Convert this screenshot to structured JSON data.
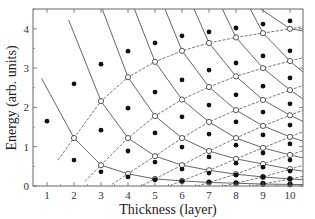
{
  "chart_data": {
    "type": "scatter",
    "title": "",
    "xlabel": "Thickness (layer)",
    "ylabel": "Energy (arb. units)",
    "xlim": [
      0.5,
      10.5
    ],
    "ylim": [
      0,
      4.5
    ],
    "x_ticks": [
      1,
      2,
      3,
      4,
      5,
      6,
      7,
      8,
      9,
      10
    ],
    "y_ticks": [
      0,
      1,
      2,
      3,
      4
    ],
    "grid": false,
    "legend": null,
    "series": [
      {
        "name": "discrete levels (filled dots)",
        "marker": "filled-circle",
        "points": [
          [
            1,
            1.65
          ],
          [
            2,
            2.6
          ],
          [
            2,
            0.66
          ],
          [
            3,
            3.1
          ],
          [
            3,
            1.42
          ],
          [
            3,
            0.36
          ],
          [
            4,
            3.43
          ],
          [
            4,
            1.98
          ],
          [
            4,
            0.89
          ],
          [
            4,
            0.23
          ],
          [
            5,
            3.64
          ],
          [
            5,
            2.39
          ],
          [
            5,
            1.35
          ],
          [
            5,
            0.61
          ],
          [
            5,
            0.16
          ],
          [
            6,
            3.82
          ],
          [
            6,
            2.7
          ],
          [
            6,
            1.76
          ],
          [
            6,
            0.99
          ],
          [
            6,
            0.43
          ],
          [
            6,
            0.12
          ],
          [
            7,
            3.92
          ],
          [
            7,
            2.95
          ],
          [
            7,
            2.06
          ],
          [
            7,
            1.32
          ],
          [
            7,
            0.74
          ],
          [
            7,
            0.33
          ],
          [
            7,
            0.1
          ],
          [
            8,
            4.02
          ],
          [
            8,
            3.13
          ],
          [
            8,
            2.32
          ],
          [
            8,
            1.63
          ],
          [
            8,
            1.04
          ],
          [
            8,
            0.58
          ],
          [
            8,
            0.28
          ],
          [
            8,
            0.08
          ],
          [
            9,
            4.12
          ],
          [
            9,
            3.31
          ],
          [
            9,
            2.54
          ],
          [
            9,
            1.88
          ],
          [
            9,
            1.3
          ],
          [
            9,
            0.84
          ],
          [
            9,
            0.48
          ],
          [
            9,
            0.23
          ],
          [
            9,
            0.07
          ],
          [
            10,
            4.2
          ],
          [
            10,
            3.44
          ],
          [
            10,
            2.75
          ],
          [
            10,
            2.09
          ],
          [
            10,
            1.55
          ],
          [
            10,
            1.07
          ],
          [
            10,
            0.66
          ],
          [
            10,
            0.38
          ],
          [
            10,
            0.18
          ],
          [
            10,
            0.05
          ]
        ]
      },
      {
        "name": "curve intersections (open circles)",
        "marker": "open-circle",
        "points": [
          [
            2,
            1.22
          ],
          [
            3,
            2.16
          ],
          [
            3,
            0.53
          ],
          [
            4,
            2.77
          ],
          [
            4,
            1.22
          ],
          [
            4,
            0.31
          ],
          [
            5,
            3.16
          ],
          [
            5,
            1.78
          ],
          [
            5,
            0.76
          ],
          [
            5,
            0.18
          ],
          [
            6,
            3.44
          ],
          [
            6,
            2.2
          ],
          [
            6,
            1.22
          ],
          [
            6,
            0.53
          ],
          [
            6,
            0.13
          ],
          [
            7,
            3.64
          ],
          [
            7,
            2.52
          ],
          [
            7,
            1.63
          ],
          [
            7,
            0.89
          ],
          [
            7,
            0.4
          ],
          [
            7,
            0.09
          ],
          [
            8,
            3.78
          ],
          [
            8,
            2.79
          ],
          [
            8,
            1.93
          ],
          [
            8,
            1.22
          ],
          [
            8,
            0.69
          ],
          [
            8,
            0.3
          ],
          [
            8,
            0.07
          ],
          [
            9,
            3.89
          ],
          [
            9,
            3.0
          ],
          [
            9,
            2.19
          ],
          [
            9,
            1.53
          ],
          [
            9,
            0.97
          ],
          [
            9,
            0.56
          ],
          [
            9,
            0.23
          ],
          [
            9,
            0.05
          ],
          [
            10,
            4.0
          ],
          [
            10,
            3.18
          ],
          [
            10,
            2.44
          ],
          [
            10,
            1.8
          ],
          [
            10,
            1.25
          ],
          [
            10,
            0.79
          ],
          [
            10,
            0.43
          ],
          [
            10,
            0.18
          ],
          [
            10,
            0.04
          ]
        ]
      }
    ],
    "lines": {
      "solid": "descending branches through open circles (j-th from bottom at each thickness)",
      "dashed": "ascending branches through open circles (k-th from top at each thickness)"
    }
  },
  "axes": {
    "x_title": "Thickness (layer)",
    "y_title": "Energy (arb. units)",
    "x_tick_labels": [
      "1",
      "2",
      "3",
      "4",
      "5",
      "6",
      "7",
      "8",
      "9",
      "10"
    ],
    "y_tick_labels": [
      "0",
      "1",
      "2",
      "3",
      "4"
    ]
  },
  "style": {
    "line_color": "#555555",
    "dot_color": "#111111",
    "frame_color": "#666666"
  }
}
